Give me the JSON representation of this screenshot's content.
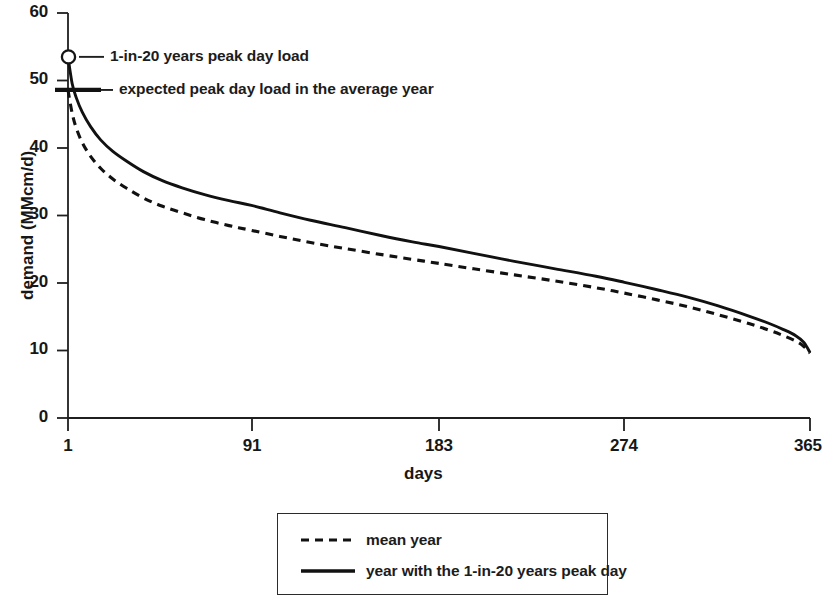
{
  "chart_data": {
    "type": "line",
    "title": "",
    "xlabel": "days",
    "ylabel": "demand (MMcm/d)",
    "xlim": [
      1,
      365
    ],
    "ylim": [
      0,
      60
    ],
    "grid": false,
    "legend_position": "bottom-center",
    "x_ticks": [
      "1",
      "91",
      "183",
      "274",
      "365"
    ],
    "x_tick_values": [
      1,
      91,
      183,
      274,
      365
    ],
    "y_ticks": [
      "0",
      "10",
      "20",
      "30",
      "40",
      "50",
      "60"
    ],
    "y_tick_values": [
      0,
      10,
      20,
      30,
      40,
      50,
      60
    ],
    "x": [
      1,
      3,
      5,
      8,
      12,
      17,
      23,
      30,
      38,
      47,
      57,
      68,
      80,
      91,
      105,
      120,
      137,
      155,
      170,
      183,
      200,
      220,
      240,
      260,
      274,
      290,
      305,
      320,
      335,
      345,
      352,
      358,
      362,
      365
    ],
    "series": [
      {
        "name": "mean year",
        "style": "dashed",
        "color": "#111111",
        "values": [
          48.6,
          45.2,
          43.0,
          40.8,
          38.8,
          37.0,
          35.4,
          34.0,
          32.6,
          31.4,
          30.4,
          29.4,
          28.5,
          27.8,
          26.9,
          26.0,
          25.1,
          24.2,
          23.5,
          22.9,
          22.1,
          21.2,
          20.3,
          19.3,
          18.5,
          17.5,
          16.5,
          15.3,
          14.0,
          13.0,
          12.2,
          11.4,
          10.6,
          9.6
        ]
      },
      {
        "name": "year with the 1-in-20 years peak day",
        "style": "solid",
        "color": "#111111",
        "values": [
          53.5,
          49.6,
          47.5,
          45.3,
          43.2,
          41.2,
          39.5,
          38.0,
          36.5,
          35.2,
          34.1,
          33.1,
          32.2,
          31.5,
          30.4,
          29.3,
          28.2,
          27.0,
          26.1,
          25.4,
          24.4,
          23.2,
          22.1,
          21.0,
          20.1,
          19.0,
          17.9,
          16.6,
          15.1,
          14.0,
          13.1,
          12.2,
          11.2,
          9.7
        ]
      }
    ],
    "annotations": [
      {
        "id": "peak-1-in-20",
        "label": "1-in-20 years peak day load",
        "marker": "open-circle",
        "x": 1,
        "y": 53.5
      },
      {
        "id": "expected-peak-average",
        "label": "expected peak day load in the average year",
        "marker": "horizontal-bar",
        "x": 1,
        "y": 48.6
      }
    ]
  },
  "legend": {
    "items": [
      {
        "label": "mean year",
        "style": "dashed"
      },
      {
        "label": "year with the 1-in-20 years peak day",
        "style": "solid"
      }
    ]
  },
  "axes": {
    "y_title": "demand (MMcm/d)",
    "x_title": "days"
  }
}
